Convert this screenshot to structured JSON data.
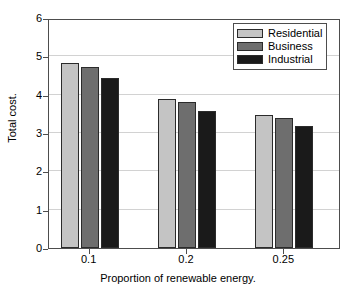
{
  "chart_data": {
    "type": "bar",
    "title": "",
    "xlabel": "Proportion of renewable energy.",
    "ylabel": "Total cost.",
    "categories": [
      "0.1",
      "0.2",
      "0.25"
    ],
    "series": [
      {
        "name": "Residential",
        "color": "#c4c4c4",
        "values": [
          4.83,
          3.89,
          3.46
        ]
      },
      {
        "name": "Business",
        "color": "#6e6e6e",
        "values": [
          4.72,
          3.8,
          3.38
        ]
      },
      {
        "name": "Industrial",
        "color": "#1a1a1a",
        "values": [
          4.43,
          3.58,
          3.18
        ]
      }
    ],
    "ylim": [
      0,
      6
    ],
    "yticks": [
      "0",
      "1",
      "2",
      "3",
      "4",
      "5",
      "6"
    ],
    "ytick_values": [
      0,
      1,
      2,
      3,
      4,
      5,
      6
    ],
    "xlim_categories": 3,
    "grid": true,
    "grid_axis": "y",
    "legend_position": "top-right",
    "legend": [
      "Residential",
      "Business",
      "Industrial"
    ],
    "bar_edge_color": "#2b2b2b",
    "axis_color": "#4d4d4d",
    "grid_color": "#d2d2d2",
    "background": "#ffffff"
  }
}
